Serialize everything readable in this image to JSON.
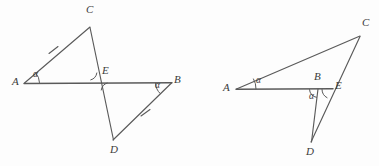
{
  "figure": {
    "background_color": "#fdfdfd",
    "stroke_color": "#5a5a5a",
    "text_color": "#3b3b3b",
    "width": 379,
    "height": 166
  },
  "left_diagram": {
    "name": "left-figure",
    "description": "Triangle ACE and triangle BDE crossing at point E on line AB",
    "points": {
      "A": {
        "label": "A",
        "x": 24,
        "y": 83,
        "label_x": 12,
        "label_y": 77
      },
      "B": {
        "label": "B",
        "x": 171,
        "y": 83,
        "label_x": 174,
        "label_y": 75
      },
      "C": {
        "label": "C",
        "x": 90,
        "y": 27,
        "label_x": 86,
        "label_y": 5
      },
      "D": {
        "label": "D",
        "x": 113,
        "y": 140,
        "label_x": 110,
        "label_y": 144
      },
      "E": {
        "label": "E",
        "x": 99,
        "y": 81,
        "label_x": 102,
        "label_y": 66
      }
    },
    "segments": [
      {
        "name": "segment-AB",
        "from": "A",
        "to": "B"
      },
      {
        "name": "segment-AC",
        "from": "A",
        "to": "C"
      },
      {
        "name": "segment-CD",
        "from": "C",
        "to": "D"
      },
      {
        "name": "segment-DB",
        "from": "D",
        "to": "B"
      }
    ],
    "tick_marks": [
      {
        "name": "tick-on-AC",
        "x": 53,
        "y": 50
      },
      {
        "name": "tick-on-DB",
        "x": 145,
        "y": 113
      }
    ],
    "angle_labels": [
      {
        "name": "angle-alpha-at-A",
        "text": "α",
        "x": 33,
        "y": 71
      },
      {
        "name": "angle-alpha-at-B",
        "text": "α",
        "x": 157,
        "y": 81
      }
    ],
    "angle_arcs": [
      {
        "name": "arc-at-A",
        "cx": 24,
        "cy": 83,
        "r": 15,
        "start": -45,
        "end": 0
      },
      {
        "name": "arc-at-B",
        "cx": 171,
        "cy": 83,
        "r": 16,
        "start": 180,
        "end": 222
      },
      {
        "name": "arc-at-E-upper",
        "cx": 99,
        "cy": 81,
        "r": 9,
        "start": 186,
        "end": 258
      },
      {
        "name": "arc-at-E-lower",
        "cx": 99,
        "cy": 81,
        "r": 9,
        "start": 6,
        "end": 78
      }
    ]
  },
  "right_diagram": {
    "name": "right-figure",
    "description": "Triangle ABC with cevian and triangle BDE sharing point E on segment CD",
    "points": {
      "A": {
        "label": "A",
        "x": 236,
        "y": 89,
        "label_x": 224,
        "label_y": 83
      },
      "B": {
        "label": "B",
        "x": 318,
        "y": 89,
        "label_x": 314,
        "label_y": 72
      },
      "C": {
        "label": "C",
        "x": 360,
        "y": 36,
        "label_x": 362,
        "label_y": 18
      },
      "D": {
        "label": "D",
        "x": 311,
        "y": 142,
        "label_x": 307,
        "label_y": 146
      },
      "E": {
        "label": "E",
        "x": 332,
        "y": 89,
        "label_x": 335,
        "label_y": 81
      }
    },
    "segments": [
      {
        "name": "segment-AB",
        "from": "A",
        "to": "B"
      },
      {
        "name": "segment-BE",
        "from": "B",
        "to": "E"
      },
      {
        "name": "segment-AC",
        "from": "A",
        "to": "C"
      },
      {
        "name": "segment-CD",
        "from": "C",
        "to": "D"
      },
      {
        "name": "segment-BD",
        "from": "B",
        "to": "D"
      }
    ],
    "tick_marks": [],
    "angle_labels": [
      {
        "name": "angle-alpha-at-A",
        "text": "α",
        "x": 257,
        "y": 77
      },
      {
        "name": "angle-alpha-at-B",
        "text": "α",
        "x": 310,
        "y": 93
      }
    ],
    "angle_arcs": [
      {
        "name": "arc-at-A",
        "cx": 236,
        "cy": 89,
        "r": 20,
        "start": -31,
        "end": 0
      },
      {
        "name": "arc-at-B",
        "cx": 318,
        "cy": 89,
        "r": 9,
        "start": 0,
        "end": 75
      },
      {
        "name": "arc-at-E",
        "cx": 332,
        "cy": 89,
        "r": 10,
        "start": 180,
        "end": 248
      }
    ]
  }
}
